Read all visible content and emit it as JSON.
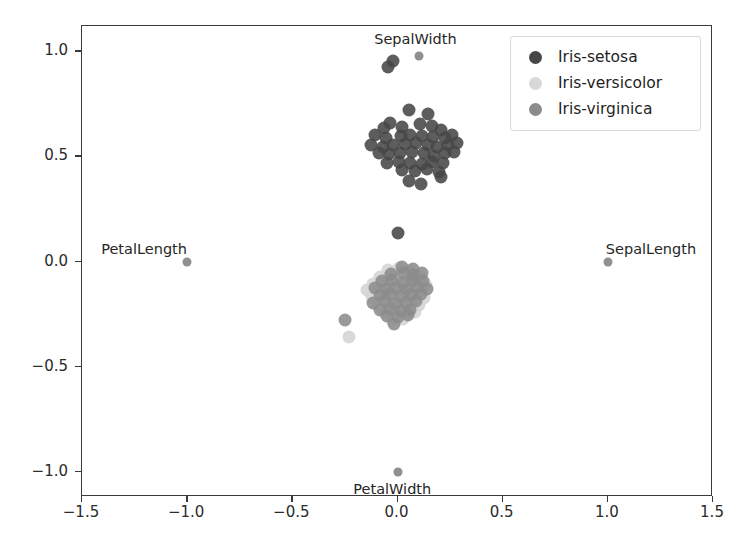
{
  "chart_data": {
    "type": "scatter",
    "title": "",
    "xlabel": "",
    "ylabel": "",
    "xlim": [
      -1.5,
      1.5
    ],
    "ylim": [
      -1.12,
      1.12
    ],
    "grid": false,
    "legend_position": "top-right",
    "xticks": [
      "-1.5",
      "-1.0",
      "-0.5",
      "0.0",
      "0.5",
      "1.0",
      "1.5"
    ],
    "xtick_values": [
      -1.5,
      -1.0,
      -0.5,
      0.0,
      0.5,
      1.0,
      1.5
    ],
    "yticks": [
      "1.0",
      "0.5",
      "0.0",
      "-0.5",
      "-1.0"
    ],
    "ytick_values": [
      1.0,
      0.5,
      0.0,
      -0.5,
      -1.0
    ],
    "legend": [
      {
        "name": "Iris-setosa",
        "color": "#474747"
      },
      {
        "name": "Iris-versicolor",
        "color": "#d8d8d8"
      },
      {
        "name": "Iris-virginica",
        "color": "#8c8c8c"
      }
    ],
    "annotations": [
      {
        "text": "SepalWidth",
        "x": 0.09,
        "y": 1.055,
        "marker_x": 0.1,
        "marker_y": 0.975
      },
      {
        "text": "PetalLength",
        "x": -1.2,
        "y": 0.055,
        "marker_x": -1.0,
        "marker_y": 0.0
      },
      {
        "text": "SepalLength",
        "x": 1.21,
        "y": 0.055,
        "marker_x": 1.0,
        "marker_y": 0.0
      },
      {
        "text": "PetalWidth",
        "x": -0.02,
        "y": -1.085,
        "marker_x": 0.0,
        "marker_y": -1.0
      }
    ],
    "series": [
      {
        "name": "Iris-setosa",
        "color": "#474747",
        "marker_size": 13,
        "points": [
          [
            -0.02,
            0.955
          ],
          [
            -0.045,
            0.925
          ],
          [
            0.055,
            0.72
          ],
          [
            0.145,
            0.7
          ],
          [
            -0.065,
            0.635
          ],
          [
            -0.035,
            0.66
          ],
          [
            0.02,
            0.64
          ],
          [
            0.105,
            0.655
          ],
          [
            0.165,
            0.645
          ],
          [
            0.205,
            0.625
          ],
          [
            -0.105,
            0.6
          ],
          [
            -0.055,
            0.585
          ],
          [
            0.015,
            0.595
          ],
          [
            0.06,
            0.6
          ],
          [
            0.115,
            0.595
          ],
          [
            0.17,
            0.59
          ],
          [
            0.225,
            0.585
          ],
          [
            0.26,
            0.6
          ],
          [
            -0.125,
            0.555
          ],
          [
            -0.07,
            0.545
          ],
          [
            -0.02,
            0.555
          ],
          [
            0.035,
            0.56
          ],
          [
            0.09,
            0.565
          ],
          [
            0.145,
            0.555
          ],
          [
            0.19,
            0.545
          ],
          [
            0.24,
            0.555
          ],
          [
            0.285,
            0.565
          ],
          [
            -0.09,
            0.515
          ],
          [
            -0.04,
            0.51
          ],
          [
            0.01,
            0.515
          ],
          [
            0.07,
            0.52
          ],
          [
            0.125,
            0.515
          ],
          [
            0.175,
            0.5
          ],
          [
            0.225,
            0.515
          ],
          [
            0.27,
            0.52
          ],
          [
            -0.05,
            0.47
          ],
          [
            0.005,
            0.475
          ],
          [
            0.06,
            0.47
          ],
          [
            0.115,
            0.465
          ],
          [
            0.165,
            0.475
          ],
          [
            0.215,
            0.47
          ],
          [
            0.02,
            0.435
          ],
          [
            0.085,
            0.43
          ],
          [
            0.14,
            0.44
          ],
          [
            0.195,
            0.425
          ],
          [
            0.055,
            0.385
          ],
          [
            0.205,
            0.4
          ],
          [
            0.11,
            0.37
          ],
          [
            0.0,
            0.135
          ]
        ]
      },
      {
        "name": "Iris-versicolor",
        "color": "#d8d8d8",
        "marker_size": 13,
        "points": [
          [
            -0.045,
            -0.04
          ],
          [
            0.005,
            -0.03
          ],
          [
            0.055,
            -0.045
          ],
          [
            -0.085,
            -0.075
          ],
          [
            -0.035,
            -0.065
          ],
          [
            0.015,
            -0.07
          ],
          [
            0.065,
            -0.06
          ],
          [
            0.105,
            -0.075
          ],
          [
            -0.115,
            -0.105
          ],
          [
            -0.065,
            -0.1
          ],
          [
            -0.015,
            -0.095
          ],
          [
            0.04,
            -0.105
          ],
          [
            0.09,
            -0.1
          ],
          [
            0.135,
            -0.11
          ],
          [
            -0.145,
            -0.135
          ],
          [
            -0.095,
            -0.13
          ],
          [
            -0.045,
            -0.14
          ],
          [
            0.005,
            -0.135
          ],
          [
            0.055,
            -0.13
          ],
          [
            0.105,
            -0.14
          ],
          [
            -0.12,
            -0.17
          ],
          [
            -0.07,
            -0.165
          ],
          [
            -0.02,
            -0.175
          ],
          [
            0.03,
            -0.17
          ],
          [
            0.08,
            -0.165
          ],
          [
            0.125,
            -0.175
          ],
          [
            -0.095,
            -0.205
          ],
          [
            -0.045,
            -0.21
          ],
          [
            0.005,
            -0.2
          ],
          [
            0.055,
            -0.21
          ],
          [
            0.1,
            -0.205
          ],
          [
            -0.06,
            -0.245
          ],
          [
            -0.01,
            -0.24
          ],
          [
            0.04,
            -0.25
          ],
          [
            0.085,
            -0.24
          ],
          [
            -0.025,
            -0.28
          ],
          [
            0.025,
            -0.275
          ],
          [
            -0.23,
            -0.36
          ]
        ]
      },
      {
        "name": "Iris-virginica",
        "color": "#8c8c8c",
        "marker_size": 13,
        "points": [
          [
            0.02,
            -0.025
          ],
          [
            0.075,
            -0.035
          ],
          [
            -0.03,
            -0.06
          ],
          [
            0.025,
            -0.055
          ],
          [
            0.075,
            -0.065
          ],
          [
            0.115,
            -0.055
          ],
          [
            -0.075,
            -0.095
          ],
          [
            -0.025,
            -0.09
          ],
          [
            0.025,
            -0.1
          ],
          [
            0.075,
            -0.09
          ],
          [
            0.12,
            -0.095
          ],
          [
            -0.105,
            -0.125
          ],
          [
            -0.055,
            -0.13
          ],
          [
            -0.005,
            -0.125
          ],
          [
            0.045,
            -0.13
          ],
          [
            0.095,
            -0.12
          ],
          [
            0.14,
            -0.13
          ],
          [
            -0.085,
            -0.16
          ],
          [
            -0.035,
            -0.155
          ],
          [
            0.015,
            -0.165
          ],
          [
            0.065,
            -0.16
          ],
          [
            0.11,
            -0.155
          ],
          [
            -0.115,
            -0.195
          ],
          [
            -0.06,
            -0.19
          ],
          [
            -0.01,
            -0.2
          ],
          [
            0.04,
            -0.195
          ],
          [
            0.09,
            -0.19
          ],
          [
            -0.085,
            -0.23
          ],
          [
            -0.035,
            -0.225
          ],
          [
            0.015,
            -0.235
          ],
          [
            0.06,
            -0.23
          ],
          [
            -0.05,
            -0.26
          ],
          [
            0.0,
            -0.265
          ],
          [
            0.05,
            -0.255
          ],
          [
            -0.015,
            -0.295
          ],
          [
            -0.25,
            -0.28
          ]
        ]
      }
    ]
  }
}
